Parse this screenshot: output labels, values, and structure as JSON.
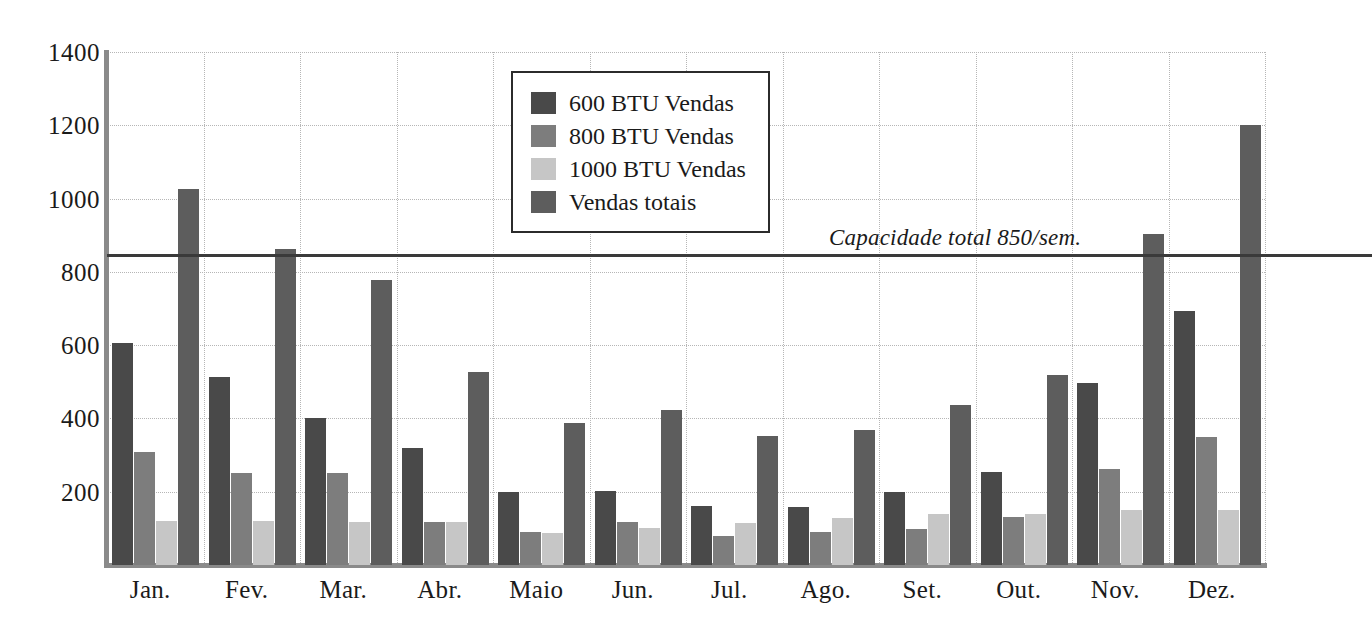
{
  "chart_data": {
    "type": "bar",
    "title": "",
    "subtitle": "",
    "xlabel": "",
    "ylabel": "",
    "categories": [
      "Jan.",
      "Fev.",
      "Mar.",
      "Abr.",
      "Maio",
      "Jun.",
      "Jul.",
      "Ago.",
      "Set.",
      "Out.",
      "Nov.",
      "Dez."
    ],
    "series": [
      {
        "name": "600 BTU Vendas",
        "color": "#494949",
        "values": [
          605,
          512,
          400,
          320,
          200,
          202,
          160,
          158,
          200,
          255,
          498,
          692
        ]
      },
      {
        "name": "800 BTU Vendas",
        "color": "#7d7d7d",
        "values": [
          308,
          250,
          250,
          118,
          90,
          118,
          78,
          90,
          98,
          130,
          262,
          350
        ]
      },
      {
        "name": "1000 BTU Vendas",
        "color": "#c6c6c6",
        "values": [
          120,
          120,
          118,
          118,
          88,
          100,
          115,
          128,
          138,
          138,
          150,
          150
        ]
      },
      {
        "name": "Vendas totais",
        "color": "#5d5d5d",
        "values": [
          1025,
          862,
          778,
          528,
          388,
          422,
          352,
          368,
          438,
          518,
          902,
          1202
        ]
      }
    ],
    "ylim": [
      0,
      1400
    ],
    "yticks": [
      200,
      400,
      600,
      800,
      1000,
      1200,
      1400
    ],
    "ytick_labels": [
      "200",
      "400",
      "600",
      "800",
      "1000",
      "1200",
      "1400"
    ],
    "grid": true,
    "grid_style": "dotted",
    "legend_position": "upper-center",
    "annotations": [
      {
        "label": "Capacidade total 850/sem.",
        "value": 850,
        "type": "horizontal-line",
        "color": "#3a3a3a"
      }
    ]
  },
  "legend": {
    "entries": [
      {
        "label": "600 BTU Vendas"
      },
      {
        "label": "800 BTU Vendas"
      },
      {
        "label": "1000 BTU Vendas"
      },
      {
        "label": "Vendas totais"
      }
    ]
  },
  "capacity": {
    "label": "Capacidade total 850/sem."
  }
}
